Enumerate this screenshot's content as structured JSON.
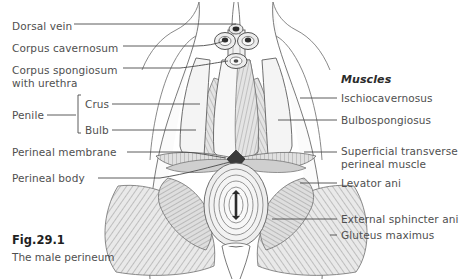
{
  "figure": {
    "number": "Fig.29.1",
    "caption": "The male perineum"
  },
  "colors": {
    "text": "#4f4f4f",
    "heading": "#2b2b2b",
    "line": "#444444",
    "outline": "#555555",
    "fill_light": "#f2f2f2",
    "fill_mid": "#dcdcdc",
    "fill_dark": "#bdbdbd",
    "perineal_body": "#3a3a3a"
  },
  "left_labels": [
    {
      "id": "dorsal-vein",
      "text": "Dorsal vein",
      "x": 12,
      "y": 20
    },
    {
      "id": "corpus-cavernosum",
      "text": "Corpus cavernosum",
      "x": 12,
      "y": 42
    },
    {
      "id": "corpus-spongiosum",
      "text": "Corpus spongiosum",
      "x": 12,
      "y": 64
    },
    {
      "id": "corpus-spongiosum-line2",
      "text": "with urethra",
      "x": 12,
      "y": 77
    },
    {
      "id": "penile",
      "text": "Penile",
      "x": 12,
      "y": 114
    },
    {
      "id": "crus",
      "text": "Crus",
      "x": 85,
      "y": 101
    },
    {
      "id": "bulb",
      "text": "Bulb",
      "x": 85,
      "y": 127
    },
    {
      "id": "perineal-membrane",
      "text": "Perineal membrane",
      "x": 12,
      "y": 149
    },
    {
      "id": "perineal-body",
      "text": "Perineal body",
      "x": 12,
      "y": 175
    }
  ],
  "right_labels": [
    {
      "id": "muscles-heading",
      "text": "Muscles",
      "x": 341,
      "y": 78,
      "heading": true
    },
    {
      "id": "ischiocavernosus",
      "text": "Ischiocavernosus",
      "x": 341,
      "y": 101,
      "heading": false
    },
    {
      "id": "bulbospongiosus",
      "text": "Bulbospongiosus",
      "x": 341,
      "y": 123,
      "heading": false
    },
    {
      "id": "superficial-transverse",
      "text": "Superficial transverse",
      "x": 341,
      "y": 149,
      "heading": false
    },
    {
      "id": "superficial-transverse-line2",
      "text": "perineal muscle",
      "x": 341,
      "y": 162,
      "heading": false
    },
    {
      "id": "levator-ani",
      "text": "Levator ani",
      "x": 341,
      "y": 186,
      "heading": false
    },
    {
      "id": "external-sphincter-ani",
      "text": "External sphincter ani",
      "x": 341,
      "y": 222,
      "heading": false
    },
    {
      "id": "gluteus-maximus",
      "text": "Gluteus maximus",
      "x": 341,
      "y": 238,
      "heading": false
    }
  ],
  "diagram": {
    "structures": [
      "dorsal vein",
      "corpus cavernosum (paired)",
      "corpus spongiosum with urethra",
      "penile crus",
      "penile bulb",
      "perineal membrane",
      "perineal body",
      "ischiocavernosus muscle",
      "bulbospongiosus muscle",
      "superficial transverse perineal muscle",
      "levator ani",
      "external sphincter ani",
      "gluteus maximus"
    ]
  }
}
